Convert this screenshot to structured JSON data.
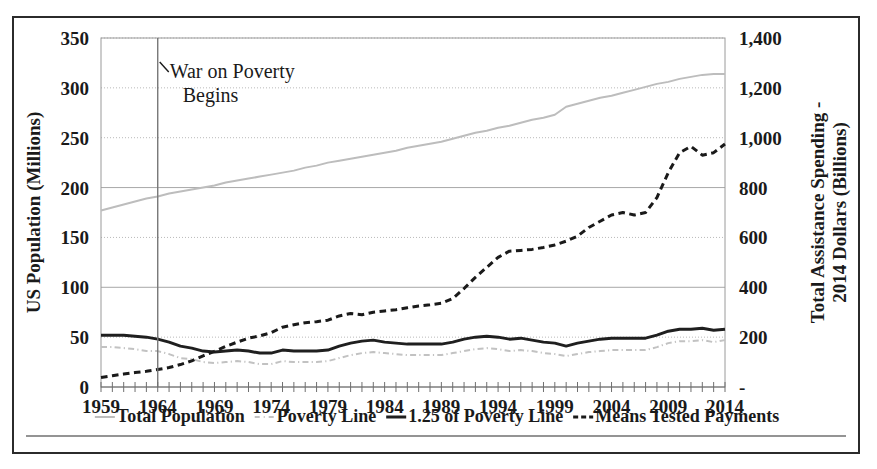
{
  "chart_data": {
    "type": "line",
    "title": "",
    "xlabel": "",
    "ylabel": "US Population (Millions)",
    "y2label": "Total Assistance Spending - 2014 Dollars (Billions)",
    "grid": true,
    "legend_position": "bottom",
    "xlim": [
      1959,
      2014
    ],
    "ylim": [
      0,
      350
    ],
    "y2lim": [
      0,
      1400
    ],
    "x_tick_labels": [
      "1959",
      "1964",
      "1969",
      "1974",
      "1979",
      "1984",
      "1989",
      "1994",
      "1999",
      "2004",
      "2009",
      "2014"
    ],
    "x_tick_values": [
      1959,
      1964,
      1969,
      1974,
      1979,
      1984,
      1989,
      1994,
      1999,
      2004,
      2009,
      2014
    ],
    "x_minor_tick_step": 1,
    "y_tick_labels": [
      "0",
      "50",
      "100",
      "150",
      "200",
      "250",
      "300",
      "350"
    ],
    "y_tick_values": [
      0,
      50,
      100,
      150,
      200,
      250,
      300,
      350
    ],
    "y2_tick_labels": [
      "-",
      "200",
      "400",
      "600",
      "800",
      "1,000",
      "1,200",
      "1,400"
    ],
    "y2_tick_values": [
      0,
      200,
      400,
      600,
      800,
      1000,
      1200,
      1400
    ],
    "annotations": [
      {
        "name": "war-on-poverty",
        "text_line_1": "War on Poverty",
        "text_line_2": "Begins",
        "x": 1964,
        "marker": "vertical-line"
      }
    ],
    "x": [
      1959,
      1960,
      1961,
      1962,
      1963,
      1964,
      1965,
      1966,
      1967,
      1968,
      1969,
      1970,
      1971,
      1972,
      1973,
      1974,
      1975,
      1976,
      1977,
      1978,
      1979,
      1980,
      1981,
      1982,
      1983,
      1984,
      1985,
      1986,
      1987,
      1988,
      1989,
      1990,
      1991,
      1992,
      1993,
      1994,
      1995,
      1996,
      1997,
      1998,
      1999,
      2000,
      2001,
      2002,
      2003,
      2004,
      2005,
      2006,
      2007,
      2008,
      2009,
      2010,
      2011,
      2012,
      2013,
      2014
    ],
    "series": [
      {
        "name": "Total Population",
        "axis": "left",
        "color": "#bdbdbd",
        "style": "solid",
        "width": 2,
        "values": [
          177,
          180,
          183,
          186,
          189,
          191,
          194,
          196,
          198,
          200,
          202,
          205,
          207,
          209,
          211,
          213,
          215,
          217,
          220,
          222,
          225,
          227,
          229,
          231,
          233,
          235,
          237,
          240,
          242,
          244,
          246,
          249,
          252,
          255,
          257,
          260,
          262,
          265,
          268,
          270,
          273,
          281,
          284,
          287,
          290,
          292,
          295,
          298,
          301,
          304,
          306,
          309,
          311,
          313,
          314,
          314
        ]
      },
      {
        "name": "Poverty Line",
        "axis": "left",
        "color": "#c2c2c2",
        "style": "dash-dot",
        "width": 2,
        "values": [
          40,
          40,
          39,
          38,
          36,
          36,
          33,
          29,
          28,
          25,
          24,
          25,
          26,
          25,
          23,
          23,
          26,
          25,
          25,
          25,
          26,
          29,
          32,
          34,
          35,
          34,
          33,
          32,
          32,
          32,
          32,
          34,
          36,
          38,
          39,
          38,
          36,
          37,
          36,
          34,
          33,
          31,
          33,
          35,
          36,
          37,
          37,
          37,
          37,
          40,
          44,
          46,
          46,
          47,
          45,
          47
        ]
      },
      {
        "name": "1.25 of Poverty Line",
        "axis": "left",
        "color": "#1f1f1f",
        "style": "solid",
        "width": 3,
        "values": [
          52,
          52,
          52,
          51,
          50,
          48,
          45,
          41,
          39,
          36,
          35,
          36,
          37,
          36,
          34,
          34,
          37,
          36,
          36,
          36,
          37,
          41,
          44,
          46,
          47,
          45,
          44,
          43,
          43,
          43,
          43,
          45,
          48,
          50,
          51,
          50,
          48,
          49,
          47,
          45,
          44,
          41,
          44,
          46,
          48,
          49,
          49,
          49,
          49,
          52,
          56,
          58,
          58,
          59,
          57,
          58
        ]
      },
      {
        "name": "Means Tested Payments",
        "axis": "right",
        "color": "#1a1a1a",
        "style": "dashed",
        "width": 3,
        "values": [
          38,
          45,
          52,
          58,
          63,
          70,
          78,
          90,
          105,
          125,
          143,
          163,
          180,
          196,
          205,
          218,
          240,
          250,
          258,
          262,
          268,
          285,
          295,
          290,
          300,
          305,
          310,
          318,
          325,
          330,
          336,
          355,
          395,
          440,
          480,
          520,
          545,
          548,
          552,
          560,
          570,
          585,
          605,
          640,
          665,
          690,
          700,
          690,
          700,
          760,
          860,
          940,
          965,
          930,
          940,
          975
        ]
      }
    ]
  },
  "legend": {
    "items": [
      {
        "label": "Total Population",
        "marker": "solid-light",
        "color": "#bdbdbd"
      },
      {
        "label": "Poverty Line",
        "marker": "dash-dot-light",
        "color": "#c2c2c2"
      },
      {
        "label": "1.25 of Poverty Line",
        "marker": "solid-dark",
        "color": "#1f1f1f"
      },
      {
        "label": "Means Tested Payments",
        "marker": "dashed-dark",
        "color": "#1a1a1a"
      }
    ]
  }
}
